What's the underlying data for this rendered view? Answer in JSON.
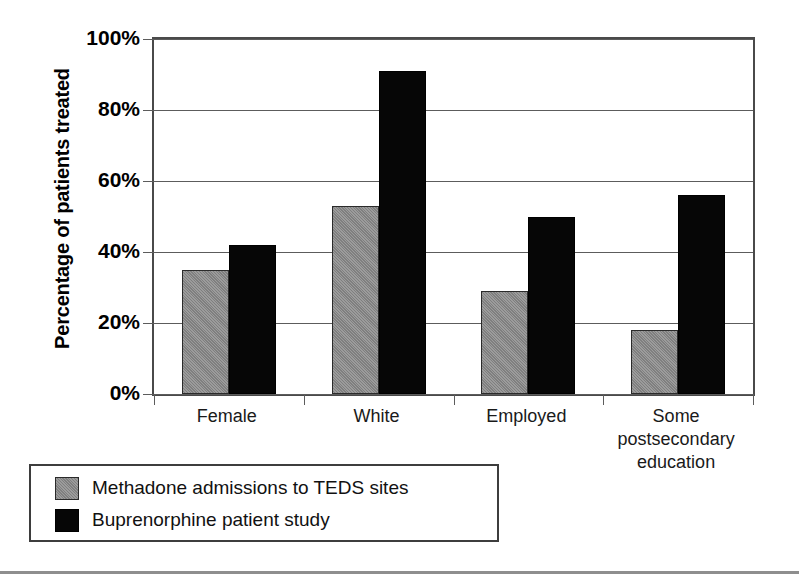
{
  "chart_data": {
    "type": "bar",
    "title": "",
    "xlabel": "",
    "ylabel": "Percentage of patients treated",
    "ylim": [
      0,
      100
    ],
    "ytick_labels": [
      "0%",
      "20%",
      "40%",
      "60%",
      "80%",
      "100%"
    ],
    "ytick_values": [
      0,
      20,
      40,
      60,
      80,
      100
    ],
    "grid": true,
    "legend_position": "below-left",
    "categories": [
      "Female",
      "White",
      "Employed",
      "Some postsecondary education"
    ],
    "category_labels": [
      "Female",
      "White",
      "Employed",
      "Some\npostsecondary\neducation"
    ],
    "series": [
      {
        "name": "Methadone admissions to TEDS sites",
        "color": "#8d8d8d",
        "values": [
          35,
          53,
          29,
          18
        ]
      },
      {
        "name": "Buprenorphine patient study",
        "color": "#060606",
        "values": [
          42,
          91,
          50,
          56
        ]
      }
    ]
  },
  "legend": {
    "entries": [
      {
        "label": "Methadone admissions to TEDS sites",
        "swatch": "gray-swatch"
      },
      {
        "label": "Buprenorphine patient study",
        "swatch": "black-swatch"
      }
    ]
  },
  "colors": {
    "series_gray": "#8d8d8d",
    "series_black": "#060606",
    "axis": "#4a4a4a",
    "gridline": "#5c5c5c",
    "background": "#ffffff"
  }
}
